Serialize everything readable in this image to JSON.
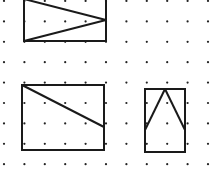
{
  "grid": {
    "origin_x": 4,
    "origin_y": 1,
    "spacing_x": 20.4,
    "spacing_y": 20.4,
    "cols": 11,
    "rows": 9,
    "dot_radius": 1.1,
    "dot_color": "#222222"
  },
  "figures": [
    {
      "name": "rectangle-with-triangle-pointing-right",
      "rect": [
        24,
        -1,
        106,
        41
      ],
      "lines": [
        [
          [
            24,
            -1
          ],
          [
            106,
            20
          ]
        ],
        [
          [
            106,
            20
          ],
          [
            24,
            41
          ]
        ]
      ]
    },
    {
      "name": "rectangle-with-diagonal",
      "rect": [
        22,
        85,
        104,
        150
      ],
      "lines": [
        [
          [
            22,
            85
          ],
          [
            104,
            127
          ]
        ]
      ]
    },
    {
      "name": "rectangle-with-triangle-pointing-up",
      "rect": [
        145,
        89,
        185,
        152
      ],
      "lines": [
        [
          [
            145,
            130
          ],
          [
            165,
            89
          ]
        ],
        [
          [
            165,
            89
          ],
          [
            185,
            130
          ]
        ]
      ]
    }
  ],
  "stroke_color": "#1a1a1a"
}
